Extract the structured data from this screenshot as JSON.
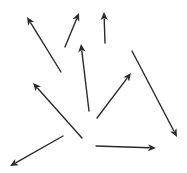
{
  "diagram": {
    "type": "vector-field-arrows",
    "width": 187,
    "height": 173,
    "background": "#ffffff",
    "stroke_color": "#2a2a2a",
    "stroke_width": 1.4,
    "arrows": [
      {
        "id": "arrow-1",
        "from": [
          61,
          72
        ],
        "to": [
          27,
          17
        ]
      },
      {
        "id": "arrow-2",
        "from": [
          65,
          47
        ],
        "to": [
          79,
          13
        ]
      },
      {
        "id": "arrow-3",
        "from": [
          105,
          43
        ],
        "to": [
          104,
          12
        ]
      },
      {
        "id": "arrow-4",
        "from": [
          89,
          111
        ],
        "to": [
          81,
          44
        ]
      },
      {
        "id": "arrow-5",
        "from": [
          132,
          51
        ],
        "to": [
          177,
          137
        ]
      },
      {
        "id": "arrow-6",
        "from": [
          97,
          118
        ],
        "to": [
          131,
          73
        ]
      },
      {
        "id": "arrow-7",
        "from": [
          82,
          138
        ],
        "to": [
          33,
          83
        ]
      },
      {
        "id": "arrow-8",
        "from": [
          63,
          136
        ],
        "to": [
          10,
          166
        ]
      },
      {
        "id": "arrow-9",
        "from": [
          96,
          146
        ],
        "to": [
          156,
          148
        ]
      }
    ]
  }
}
